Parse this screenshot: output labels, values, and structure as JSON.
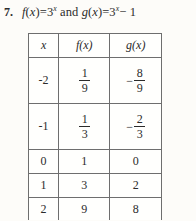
{
  "problem": {
    "number": "7.",
    "statement_plain": "f(x) = 3^x and g(x) = 3^x - 1",
    "f_name": "f",
    "g_name": "g",
    "variable": "x",
    "equals": "=",
    "base": "3",
    "exponent": "x",
    "conjunction": "and",
    "minus_one": "− 1",
    "open_paren": "(",
    "close_paren": ")"
  },
  "table": {
    "headers": {
      "x": "x",
      "f": "f(x)",
      "g": "g(x)"
    },
    "rows": [
      {
        "x": "-2",
        "f": {
          "type": "fraction",
          "sign": "",
          "num": "1",
          "den": "9",
          "display": "1/9"
        },
        "g": {
          "type": "fraction",
          "sign": "−",
          "num": "8",
          "den": "9",
          "display": "-8/9"
        }
      },
      {
        "x": "-1",
        "f": {
          "type": "fraction",
          "sign": "",
          "num": "1",
          "den": "3",
          "display": "1/3"
        },
        "g": {
          "type": "fraction",
          "sign": "−",
          "num": "2",
          "den": "3",
          "display": "-2/3"
        }
      },
      {
        "x": "0",
        "f": {
          "type": "integer",
          "value": "1"
        },
        "g": {
          "type": "integer",
          "value": "0"
        }
      },
      {
        "x": "1",
        "f": {
          "type": "integer",
          "value": "3"
        },
        "g": {
          "type": "integer",
          "value": "2"
        }
      },
      {
        "x": "2",
        "f": {
          "type": "integer",
          "value": "9"
        },
        "g": {
          "type": "integer",
          "value": "8"
        }
      }
    ]
  },
  "style": {
    "page_background": "#fdfcf9",
    "table_background": "#fffffd",
    "border_color": "#6e6e6e",
    "text_color": "#2b2b2b"
  },
  "chart_data": {
    "type": "table",
    "categories": [
      "-2",
      "-1",
      "0",
      "1",
      "2"
    ],
    "xlabel": "x",
    "series": [
      {
        "name": "f(x)",
        "values": [
          0.1111111111,
          0.3333333333,
          1,
          3,
          9
        ],
        "labels": [
          "1/9",
          "1/3",
          "1",
          "3",
          "9"
        ]
      },
      {
        "name": "g(x)",
        "values": [
          -0.8888888889,
          -0.6666666667,
          0,
          2,
          8
        ],
        "labels": [
          "-8/9",
          "-2/3",
          "0",
          "2",
          "8"
        ]
      }
    ],
    "grid": true,
    "legend": "none"
  }
}
